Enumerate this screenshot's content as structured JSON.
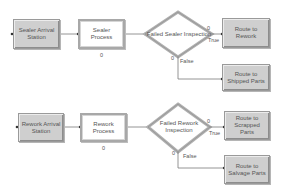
{
  "diagram": {
    "flow_1": {
      "arrival": {
        "label": "Sealer Arrival Station"
      },
      "process": {
        "label": "Sealer Process",
        "counter": "0"
      },
      "decision": {
        "label": "Failed Sealer Inspection",
        "true_counter": "0",
        "false_counter": "0",
        "true_label": "True",
        "false_label": "False"
      },
      "route_true": {
        "label": "Route to Rework"
      },
      "route_false": {
        "label": "Route to Shipped Parts"
      }
    },
    "flow_2": {
      "arrival": {
        "label": "Rework Arrival Station"
      },
      "process": {
        "label": "Rework Process",
        "counter": "0"
      },
      "decision": {
        "label": "Failed Rework Inspection",
        "true_counter": "0",
        "false_counter": "0",
        "true_label": "True",
        "false_label": "False"
      },
      "route_true": {
        "label": "Route to Scrapped Parts"
      },
      "route_false": {
        "label": "Route to Salvage Parts"
      }
    },
    "colors": {
      "shaded_fill": "#cfcfcf",
      "border": "#9a9a9a",
      "connector": "#7a7a7a",
      "diamond_outer": "#a0a0a0",
      "text": "#555555"
    }
  }
}
